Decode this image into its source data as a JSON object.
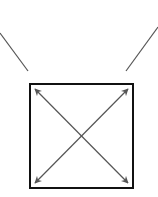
{
  "diagram": {
    "colors": {
      "background": "#ffffff",
      "box_stroke": "#111111",
      "arrow_stroke": "#555555",
      "line_stroke": "#555555"
    },
    "box": {
      "x": 29,
      "y": 84,
      "width": 104,
      "height": 104
    },
    "arrows": [
      {
        "name": "diagonal-tl-br",
        "x1": 34,
        "y1": 89,
        "x2": 128,
        "y2": 183,
        "double_headed": true
      },
      {
        "name": "diagonal-tr-bl",
        "x1": 128,
        "y1": 89,
        "x2": 34,
        "y2": 183,
        "double_headed": true
      }
    ],
    "lines": [
      {
        "name": "left-slant-line",
        "x1": 0,
        "y1": 33,
        "x2": 28,
        "y2": 71
      },
      {
        "name": "right-slant-line",
        "x1": 158,
        "y1": 27,
        "x2": 126,
        "y2": 71
      }
    ]
  }
}
